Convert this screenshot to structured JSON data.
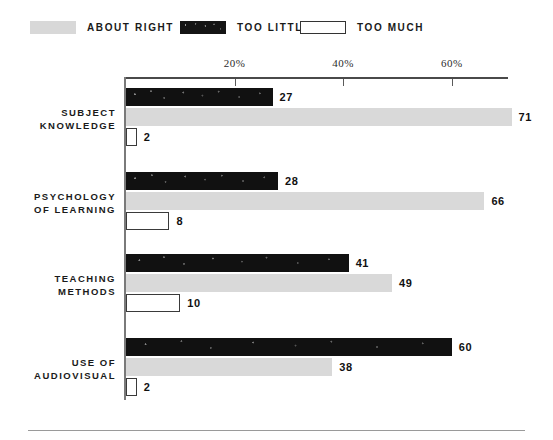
{
  "legend": {
    "items": [
      {
        "label": "ABOUT RIGHT",
        "key": "about_right",
        "swatch": "about-right-swatch",
        "color": "#d8d8d8"
      },
      {
        "label": "TOO LITTLE",
        "key": "too_little",
        "swatch": "too-little-swatch",
        "color": "#141414"
      },
      {
        "label": "TOO MUCH",
        "key": "too_much",
        "swatch": "too-much-swatch",
        "color": "#ffffff"
      }
    ]
  },
  "axis": {
    "ticks": [
      {
        "label": "20%",
        "value": 20
      },
      {
        "label": "40%",
        "value": 40
      },
      {
        "label": "60%",
        "value": 60
      }
    ]
  },
  "groups": [
    {
      "label_line1": "SUBJECT",
      "label_line2": "KNOWLEDGE",
      "bars": [
        {
          "series": "TOO LITTLE",
          "value": 27,
          "value_label": "27"
        },
        {
          "series": "ABOUT RIGHT",
          "value": 71,
          "value_label": "71"
        },
        {
          "series": "TOO MUCH",
          "value": 2,
          "value_label": "2"
        }
      ]
    },
    {
      "label_line1": "PSYCHOLOGY",
      "label_line2": "OF LEARNING",
      "bars": [
        {
          "series": "TOO LITTLE",
          "value": 28,
          "value_label": "28"
        },
        {
          "series": "ABOUT RIGHT",
          "value": 66,
          "value_label": "66"
        },
        {
          "series": "TOO MUCH",
          "value": 8,
          "value_label": "8"
        }
      ]
    },
    {
      "label_line1": "TEACHING",
      "label_line2": "METHODS",
      "bars": [
        {
          "series": "TOO LITTLE",
          "value": 41,
          "value_label": "41"
        },
        {
          "series": "ABOUT RIGHT",
          "value": 49,
          "value_label": "49"
        },
        {
          "series": "TOO MUCH",
          "value": 10,
          "value_label": "10"
        }
      ]
    },
    {
      "label_line1": "USE OF",
      "label_line2": "AUDIOVISUAL",
      "bars": [
        {
          "series": "TOO LITTLE",
          "value": 60,
          "value_label": "60"
        },
        {
          "series": "ABOUT RIGHT",
          "value": 38,
          "value_label": "38"
        },
        {
          "series": "TOO MUCH",
          "value": 2,
          "value_label": "2"
        }
      ]
    }
  ],
  "chart_data": {
    "type": "bar",
    "orientation": "horizontal",
    "title": "",
    "xlabel": "",
    "ylabel": "",
    "categories": [
      "SUBJECT KNOWLEDGE",
      "PSYCHOLOGY OF LEARNING",
      "TEACHING METHODS",
      "USE OF AUDIOVISUAL"
    ],
    "series": [
      {
        "name": "TOO LITTLE",
        "color": "#141414",
        "values": [
          27,
          28,
          41,
          60
        ]
      },
      {
        "name": "ABOUT RIGHT",
        "color": "#d8d8d8",
        "values": [
          71,
          66,
          49,
          38
        ]
      },
      {
        "name": "TOO MUCH",
        "color": "#ffffff",
        "values": [
          2,
          8,
          10,
          2
        ]
      }
    ],
    "xlim": [
      0,
      70
    ],
    "xticks": [
      20,
      40,
      60
    ],
    "xticklabels": [
      "20%",
      "40%",
      "60%"
    ],
    "grid": false,
    "legend_position": "top",
    "data_labels": true
  },
  "scale": {
    "origin_px": 126,
    "px_per_percent": 5.43
  }
}
